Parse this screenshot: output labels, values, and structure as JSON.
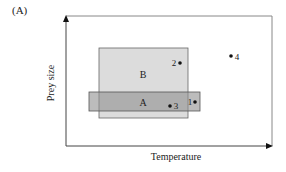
{
  "panel_label": "(A)",
  "axes": {
    "x_label": "Temperature",
    "y_label": "Prey size"
  },
  "regions": [
    {
      "id": "B",
      "label": "B",
      "x": 99,
      "y": 48,
      "w": 89,
      "h": 70,
      "fill": "#dcdcdc"
    },
    {
      "id": "A",
      "label": "A",
      "x": 89,
      "y": 92,
      "w": 111,
      "h": 19,
      "fill": "#a8a8a8"
    }
  ],
  "points": [
    {
      "id": "1",
      "label": "1",
      "x": 195,
      "y": 102
    },
    {
      "id": "2",
      "label": "2",
      "x": 180,
      "y": 63
    },
    {
      "id": "3",
      "label": "3",
      "x": 170,
      "y": 106
    },
    {
      "id": "4",
      "label": "4",
      "x": 231,
      "y": 56
    }
  ],
  "colors": {
    "axis": "#444444",
    "frame": "#777777",
    "region_b": "#dcdcdc",
    "region_a": "#a8a8a8",
    "point": "#111111"
  }
}
